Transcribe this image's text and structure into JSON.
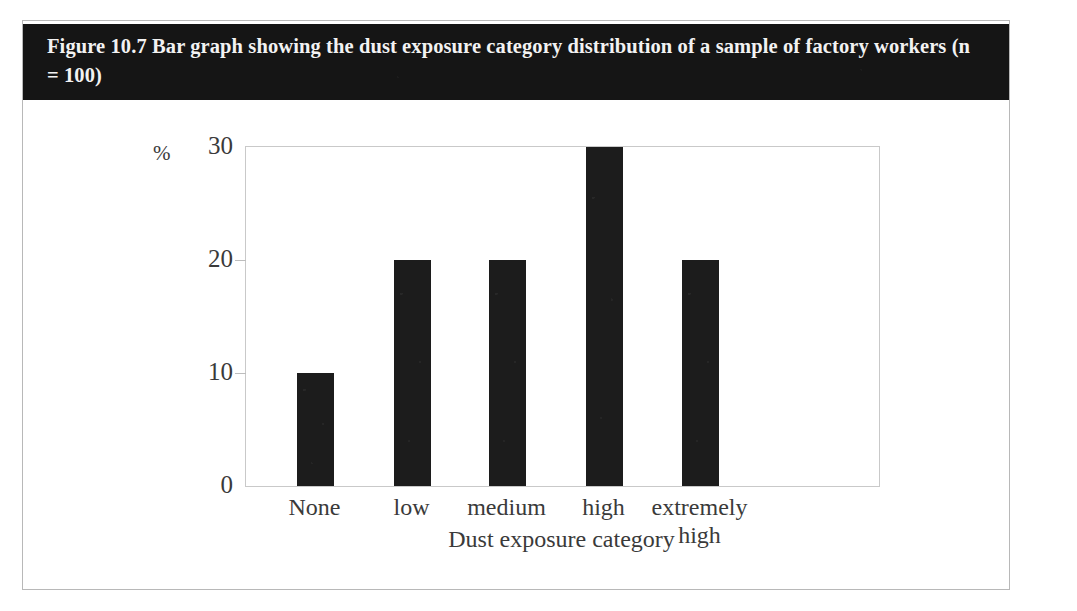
{
  "figure": {
    "caption": "Figure 10.7 Bar graph showing the dust exposure category distribution of a sample of factory workers (n = 100)",
    "caption_band_color": "#151515",
    "caption_text_color": "#f2f2f2",
    "card_border_color": "#b8b8b8"
  },
  "chart_data": {
    "type": "bar",
    "title": "Figure 10.7 Bar graph showing the dust exposure category distribution of a sample of factory workers (n = 100)",
    "categories": [
      "None",
      "low",
      "medium",
      "high",
      "extremely high"
    ],
    "category_lines": [
      [
        "None"
      ],
      [
        "low"
      ],
      [
        "medium"
      ],
      [
        "high"
      ],
      [
        "extremely",
        "high"
      ]
    ],
    "values": [
      10,
      20,
      20,
      30,
      20
    ],
    "xlabel": "Dust exposure category",
    "ylabel": "%",
    "ylim": [
      0,
      30
    ],
    "yticks": [
      0,
      10,
      20,
      30
    ],
    "ytick_labels": [
      "0",
      "10",
      "20",
      "30"
    ],
    "grid": false,
    "legend": false,
    "bar_color": "#1c1c1c",
    "axis_color": "#c9c9c9",
    "sample_size": "n = 100"
  }
}
